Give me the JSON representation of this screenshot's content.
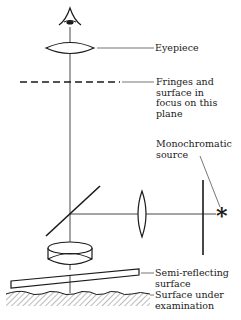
{
  "labels": {
    "eyepiece": "Eyepiece",
    "fringes": "Fringes and\nsurface in\nfocus on this\nplane",
    "source": "Monochromatic\nsource",
    "source_symbol": "*",
    "semi_reflecting": "Semi-reflecting\nsurface",
    "surface_under": "Surface under\nexamination"
  },
  "colors": {
    "ink": "#1a1a1a",
    "background": "#ffffff"
  }
}
